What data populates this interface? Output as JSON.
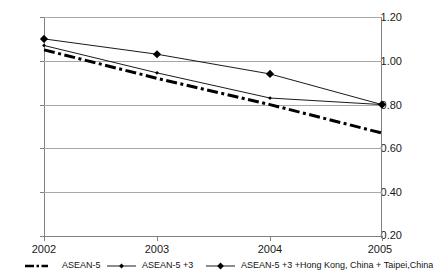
{
  "chart_data": {
    "type": "line",
    "title": "",
    "xlabel": "",
    "ylabel": "",
    "categories": [
      "2002",
      "2003",
      "2004",
      "2005"
    ],
    "x": [
      2002,
      2003,
      2004,
      2005
    ],
    "ylim": [
      0.2,
      1.2
    ],
    "ytick_labels": [
      "1.20",
      "1.00",
      "0.80",
      "0.60",
      "0.40",
      "0.20"
    ],
    "ytick_values": [
      1.2,
      1.0,
      0.8,
      0.6,
      0.4,
      0.2
    ],
    "grid": true,
    "legend_position": "bottom",
    "series": [
      {
        "name": "ASEAN-5",
        "style": "thick-dash-dot",
        "marker": "none",
        "color": "#000000",
        "values": [
          1.05,
          0.92,
          0.8,
          0.67
        ]
      },
      {
        "name": "ASEAN-5 +3",
        "style": "thin-solid",
        "marker": "small-diamond",
        "color": "#000000",
        "values": [
          1.07,
          0.945,
          0.83,
          0.8
        ]
      },
      {
        "name": "ASEAN-5 +3 +Hong Kong, China + Taipei,China",
        "style": "thin-solid",
        "marker": "diamond",
        "color": "#000000",
        "values": [
          1.1,
          1.03,
          0.94,
          0.8
        ]
      }
    ]
  },
  "legend": {
    "items": [
      {
        "label": "ASEAN-5"
      },
      {
        "label": "ASEAN-5 +3"
      },
      {
        "label": "ASEAN-5 +3 +Hong Kong, China + Taipei,China"
      }
    ]
  }
}
